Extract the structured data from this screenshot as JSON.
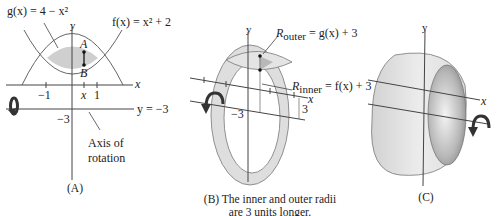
{
  "panelA": {
    "g_label": "g(x) = 4 − x²",
    "f_label": "f(x) = x² + 2",
    "y_axis": "y",
    "x_axis": "x",
    "point_A": "A",
    "point_B": "B",
    "tick_neg1": "−1",
    "tick_x": "x",
    "tick_1": "1",
    "tick_neg3": "−3",
    "axis_line_label": "y = −3",
    "axis_note_line1": "Axis of",
    "axis_note_line2": "rotation",
    "caption": "(A)"
  },
  "panelB": {
    "y_axis": "y",
    "x_axis": "x",
    "r_outer": "R",
    "r_outer_sub": "outer",
    "r_outer_rhs": " = g(x) + 3",
    "r_inner": "R",
    "r_inner_sub": "inner",
    "r_inner_rhs": " = f(x) + 3",
    "tick_neg3": "−3",
    "dim_3": "3",
    "caption_line1": "(B) The inner and outer radii",
    "caption_line2": "are 3 units longer."
  },
  "panelC": {
    "y_axis": "y",
    "x_axis": "x",
    "caption": "(C)"
  },
  "colors": {
    "stroke": "#555555",
    "fill_light": "#e2e2e2",
    "fill_mid": "#c8c8c8",
    "fill_dark": "#9a9a9a",
    "arrow": "#3a3a3a"
  }
}
